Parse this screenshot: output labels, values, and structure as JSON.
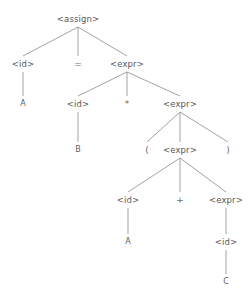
{
  "diagram": {
    "kind": "parse-tree",
    "title": "",
    "colors": {
      "background": "#ffffff",
      "node_text": "#575757",
      "terminal_text": "#5d5d5d",
      "edge": "#8a8a8a"
    },
    "nodes": [
      {
        "id": "n0",
        "label": "<assign>",
        "type": "nonterminal",
        "x": 78,
        "y": 19
      },
      {
        "id": "n1",
        "label": "<id>",
        "type": "nonterminal",
        "x": 23,
        "y": 64
      },
      {
        "id": "n2",
        "label": "=",
        "type": "punct",
        "x": 78,
        "y": 64
      },
      {
        "id": "n3",
        "label": "<expr>",
        "type": "nonterminal",
        "x": 127,
        "y": 64
      },
      {
        "id": "n4",
        "label": "A",
        "type": "terminal",
        "x": 23,
        "y": 104
      },
      {
        "id": "n5",
        "label": "<id>",
        "type": "nonterminal",
        "x": 78,
        "y": 104
      },
      {
        "id": "n6",
        "label": "*",
        "type": "punct",
        "x": 127,
        "y": 104
      },
      {
        "id": "n7",
        "label": "<expr>",
        "type": "nonterminal",
        "x": 180,
        "y": 104
      },
      {
        "id": "n8",
        "label": "B",
        "type": "terminal",
        "x": 78,
        "y": 150
      },
      {
        "id": "n9",
        "label": "(",
        "type": "punct",
        "x": 147,
        "y": 150
      },
      {
        "id": "n10",
        "label": "<expr>",
        "type": "nonterminal",
        "x": 180,
        "y": 150
      },
      {
        "id": "n11",
        "label": ")",
        "type": "punct",
        "x": 228,
        "y": 150
      },
      {
        "id": "n12",
        "label": "<id>",
        "type": "nonterminal",
        "x": 128,
        "y": 200
      },
      {
        "id": "n13",
        "label": "+",
        "type": "punct",
        "x": 180,
        "y": 200
      },
      {
        "id": "n14",
        "label": "<expr>",
        "type": "nonterminal",
        "x": 226,
        "y": 200
      },
      {
        "id": "n15",
        "label": "A",
        "type": "terminal",
        "x": 128,
        "y": 242
      },
      {
        "id": "n16",
        "label": "<id>",
        "type": "nonterminal",
        "x": 226,
        "y": 242
      },
      {
        "id": "n17",
        "label": "C",
        "type": "terminal",
        "x": 226,
        "y": 282
      }
    ],
    "edges": [
      {
        "from": "n0",
        "to": "n1"
      },
      {
        "from": "n0",
        "to": "n2"
      },
      {
        "from": "n0",
        "to": "n3"
      },
      {
        "from": "n1",
        "to": "n4"
      },
      {
        "from": "n3",
        "to": "n5"
      },
      {
        "from": "n3",
        "to": "n6"
      },
      {
        "from": "n3",
        "to": "n7"
      },
      {
        "from": "n5",
        "to": "n8"
      },
      {
        "from": "n7",
        "to": "n9"
      },
      {
        "from": "n7",
        "to": "n10"
      },
      {
        "from": "n7",
        "to": "n11"
      },
      {
        "from": "n10",
        "to": "n12"
      },
      {
        "from": "n10",
        "to": "n13"
      },
      {
        "from": "n10",
        "to": "n14"
      },
      {
        "from": "n12",
        "to": "n15"
      },
      {
        "from": "n14",
        "to": "n16"
      },
      {
        "from": "n16",
        "to": "n17"
      }
    ]
  }
}
